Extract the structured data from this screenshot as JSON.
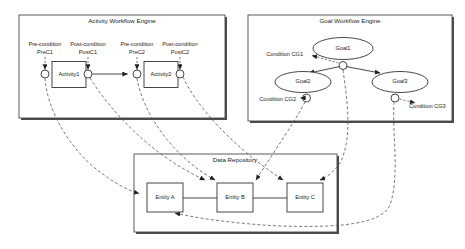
{
  "diagram": {
    "panels": [
      {
        "id": "activity",
        "title": "Activity Workflow Engine"
      },
      {
        "id": "goal",
        "title": "Goal Workflow Engine"
      },
      {
        "id": "repository",
        "title": "Data Repository"
      }
    ]
  },
  "activity_engine": {
    "title": "Activity Workflow Engine",
    "activities": [
      {
        "name": "Activity1",
        "pre_condition_label": "Pre-condition",
        "pre_condition_name": "PreC1",
        "post_condition_label": "Post-condition",
        "post_condition_name": "PostC1"
      },
      {
        "name": "Activity2",
        "pre_condition_label": "Pre-condition",
        "pre_condition_name": "PreC2",
        "post_condition_label": "Post-condition",
        "post_condition_name": "PostC2"
      }
    ]
  },
  "goal_engine": {
    "title": "Goal Workflow Engine",
    "goals": [
      {
        "name": "Goal1",
        "condition": "Condition CG1"
      },
      {
        "name": "Goal2",
        "condition": "Condition CG2"
      },
      {
        "name": "Goal3",
        "condition": "Condition CG3"
      }
    ]
  },
  "data_repository": {
    "title": "Data Repository",
    "entities": [
      {
        "name": "Entity A"
      },
      {
        "name": "Entity B"
      },
      {
        "name": "Entity C"
      }
    ]
  },
  "colors": {
    "background": "#ffffff",
    "stroke": "#333333",
    "panel_stroke": "#4a4a4a",
    "shadow": "#4c4c4c",
    "dashed": "#555555",
    "text": "#1a1a1a"
  }
}
